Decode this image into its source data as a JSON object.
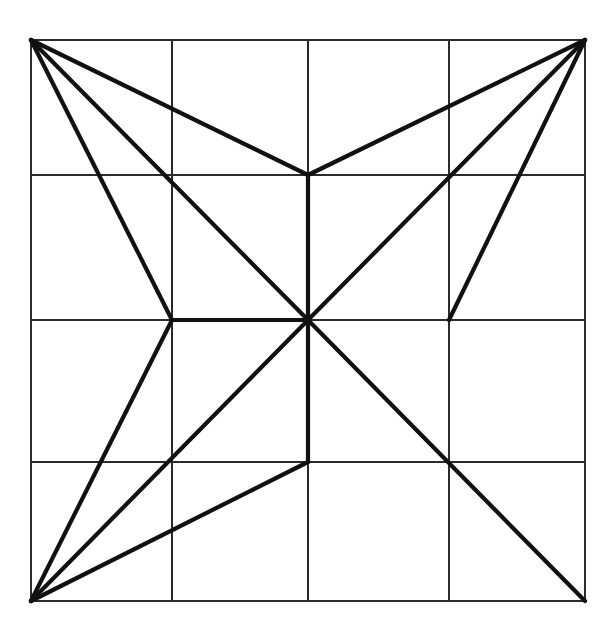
{
  "figure": {
    "canvas": {
      "width": 616,
      "height": 637,
      "background_color": "#ffffff"
    },
    "grid": {
      "rows": 4,
      "cols": 4,
      "stroke_color": "#2b2b2b",
      "stroke_width": 1.1,
      "x_positions": [
        31,
        172,
        308,
        449,
        585
      ],
      "y_positions": [
        40,
        175,
        320,
        462,
        601
      ],
      "bounds": {
        "left": 31,
        "top": 40,
        "right": 585,
        "bottom": 601
      }
    },
    "overlay": {
      "stroke_color": "#111111",
      "stroke_width": 4.2
    },
    "vertices": {
      "top_left": {
        "name": "top-left-corner",
        "x": 31,
        "y": 40
      },
      "top_right": {
        "name": "top-right-corner",
        "x": 585,
        "y": 40
      },
      "bottom_left": {
        "name": "bottom-left-corner",
        "x": 31,
        "y": 601
      },
      "bottom_right": {
        "name": "bottom-right-corner",
        "x": 585,
        "y": 601
      },
      "center": {
        "name": "center-node",
        "x": 308,
        "y": 320
      },
      "top_mid": {
        "name": "top-middle-node",
        "x": 308,
        "y": 175
      },
      "left_mid": {
        "name": "left-middle-node",
        "x": 172,
        "y": 320
      },
      "right_mid": {
        "name": "right-middle-node",
        "x": 449,
        "y": 320
      },
      "bottom_mid": {
        "name": "bottom-middle-node",
        "x": 308,
        "y": 462
      }
    },
    "grid_lines": [
      {
        "name": "grid-vertical-1",
        "x1": 31,
        "y1": 40,
        "x2": 31,
        "y2": 601
      },
      {
        "name": "grid-vertical-2",
        "x1": 172,
        "y1": 40,
        "x2": 172,
        "y2": 601
      },
      {
        "name": "grid-vertical-3",
        "x1": 308,
        "y1": 40,
        "x2": 308,
        "y2": 601
      },
      {
        "name": "grid-vertical-4",
        "x1": 449,
        "y1": 40,
        "x2": 449,
        "y2": 601
      },
      {
        "name": "grid-vertical-5",
        "x1": 585,
        "y1": 40,
        "x2": 585,
        "y2": 601
      },
      {
        "name": "grid-horizontal-1",
        "x1": 31,
        "y1": 40,
        "x2": 585,
        "y2": 40
      },
      {
        "name": "grid-horizontal-2",
        "x1": 31,
        "y1": 175,
        "x2": 585,
        "y2": 175
      },
      {
        "name": "grid-horizontal-3",
        "x1": 31,
        "y1": 320,
        "x2": 585,
        "y2": 320
      },
      {
        "name": "grid-horizontal-4",
        "x1": 31,
        "y1": 462,
        "x2": 585,
        "y2": 462
      },
      {
        "name": "grid-horizontal-5",
        "x1": 31,
        "y1": 601,
        "x2": 585,
        "y2": 601
      }
    ],
    "overlay_lines": [
      {
        "name": "edge-topleft-to-topmid",
        "from": "top_left",
        "to": "top_mid",
        "x1": 31,
        "y1": 40,
        "x2": 308,
        "y2": 175
      },
      {
        "name": "edge-topleft-to-center",
        "from": "top_left",
        "to": "center",
        "x1": 31,
        "y1": 40,
        "x2": 308,
        "y2": 320
      },
      {
        "name": "edge-topleft-to-leftmid",
        "from": "top_left",
        "to": "left_mid",
        "x1": 31,
        "y1": 40,
        "x2": 172,
        "y2": 320
      },
      {
        "name": "edge-topright-to-topmid",
        "from": "top_right",
        "to": "top_mid",
        "x1": 585,
        "y1": 40,
        "x2": 308,
        "y2": 175
      },
      {
        "name": "edge-topright-to-center",
        "from": "top_right",
        "to": "center",
        "x1": 585,
        "y1": 40,
        "x2": 308,
        "y2": 320
      },
      {
        "name": "edge-topright-to-rightmid",
        "from": "top_right",
        "to": "right_mid",
        "x1": 585,
        "y1": 40,
        "x2": 449,
        "y2": 320
      },
      {
        "name": "edge-bottomleft-to-leftmid",
        "from": "bottom_left",
        "to": "left_mid",
        "x1": 31,
        "y1": 601,
        "x2": 172,
        "y2": 320
      },
      {
        "name": "edge-bottomleft-to-center",
        "from": "bottom_left",
        "to": "center",
        "x1": 31,
        "y1": 601,
        "x2": 308,
        "y2": 320
      },
      {
        "name": "edge-bottomleft-to-bottommid",
        "from": "bottom_left",
        "to": "bottom_mid",
        "x1": 31,
        "y1": 601,
        "x2": 308,
        "y2": 462
      },
      {
        "name": "edge-center-to-bottomright",
        "from": "center",
        "to": "bottom_right",
        "x1": 308,
        "y1": 320,
        "x2": 585,
        "y2": 601
      },
      {
        "name": "edge-topmid-to-bottommid",
        "from": "top_mid",
        "to": "bottom_mid",
        "x1": 308,
        "y1": 175,
        "x2": 308,
        "y2": 462
      },
      {
        "name": "edge-leftmid-to-center",
        "from": "left_mid",
        "to": "center",
        "x1": 172,
        "y1": 320,
        "x2": 308,
        "y2": 320
      }
    ]
  },
  "chart_data": {
    "type": "diagram",
    "grid_x": [
      31,
      172,
      308,
      449,
      585
    ],
    "grid_y": [
      40,
      175,
      320,
      462,
      601
    ],
    "node_count": 9,
    "overlay_edge_count": 12
  }
}
